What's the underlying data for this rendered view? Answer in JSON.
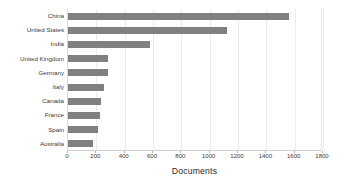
{
  "chart_data": {
    "type": "bar",
    "orientation": "horizontal",
    "title": "",
    "xlabel": "Documents",
    "ylabel": "",
    "categories": [
      "China",
      "United States",
      "India",
      "United Kingdom",
      "Germany",
      "Italy",
      "Canada",
      "France",
      "Spain",
      "Australia"
    ],
    "values": [
      1560,
      1120,
      580,
      285,
      280,
      255,
      235,
      225,
      215,
      175
    ],
    "xlim": [
      0,
      1800
    ],
    "xticks": [
      0,
      200,
      400,
      600,
      800,
      1000,
      1200,
      1400,
      1600,
      1800
    ],
    "xtick_labels": [
      "0",
      "200",
      "400",
      "600",
      "800",
      "1000",
      "1200",
      "1400",
      "1600",
      "1800"
    ],
    "grid": "vertical",
    "legend": "none",
    "bar_color": "#808080",
    "gridline_color": "#ececec",
    "axis_color": "#d0d0d0",
    "text_color": "#3a3a3a",
    "background": "#ffffff"
  }
}
